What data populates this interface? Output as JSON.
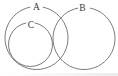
{
  "figure": {
    "type": "venn-diagram",
    "background_color": "#ffffff",
    "stroke_color": "#6b6b6b",
    "label_color": "#3b3b3b",
    "canvas": {
      "width": 118,
      "height": 76
    }
  },
  "labels": {
    "a": "A",
    "b": "B",
    "c": "C"
  },
  "chart_data": {
    "type": "diagram",
    "title": "",
    "shapes": [
      {
        "name": "circle-a",
        "label": "A",
        "cx": 36.5,
        "cy": 38.0,
        "r": 31.5,
        "relation": "overlaps B; contains C"
      },
      {
        "name": "circle-b",
        "label": "B",
        "cx": 84.0,
        "cy": 38.5,
        "r": 31.0,
        "relation": "overlaps A"
      },
      {
        "name": "circle-c",
        "label": "C",
        "cx": 30.5,
        "cy": 44.5,
        "r": 22.0,
        "relation": "inside A, internally tangent lower-left"
      }
    ],
    "label_positions": [
      {
        "text": "A",
        "x": 36.5,
        "y": 8.0
      },
      {
        "text": "B",
        "x": 82.5,
        "y": 8.5
      },
      {
        "text": "C",
        "x": 31.0,
        "y": 25.5
      }
    ],
    "intersections": [
      {
        "between": [
          "A",
          "B"
        ],
        "x": 62.0,
        "y": 20.0
      },
      {
        "between": [
          "A",
          "B"
        ],
        "x": 62.0,
        "y": 57.5
      }
    ]
  }
}
